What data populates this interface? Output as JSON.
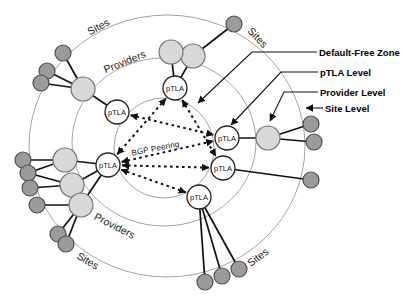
{
  "figure": {
    "colors": {
      "background": "#ffffff",
      "ring_stroke": "#999999",
      "line": "#111111",
      "provider_fill": "#d8d8d8",
      "provider_stroke": "#777777",
      "site_fill": "#9b9b9b",
      "site_stroke": "#4f4f4f",
      "ptla_fill": "#ffffff",
      "ptla_stroke": "#222222"
    },
    "rings": [
      {
        "name": "outer-site-ring",
        "cx": 167,
        "cy": 146,
        "rx": 138,
        "ry": 131
      },
      {
        "name": "middle-provider-ring",
        "cx": 164,
        "cy": 142,
        "rx": 92,
        "ry": 84
      },
      {
        "name": "inner-dfz-circle",
        "cx": 164,
        "cy": 148,
        "rx": 50,
        "ry": 50
      }
    ],
    "ring_labels": [
      {
        "name": "sites-label-top-left",
        "text": "Sites",
        "x": 100,
        "y": 30,
        "rotate": -28
      },
      {
        "name": "providers-label-top-left",
        "text": "Providers",
        "x": 126,
        "y": 65,
        "rotate": -22
      },
      {
        "name": "sites-label-top-right",
        "text": "Sites",
        "x": 255,
        "y": 40,
        "rotate": 47
      },
      {
        "name": "providers-label-bottom-left",
        "text": "Providers",
        "x": 113,
        "y": 229,
        "rotate": 27
      },
      {
        "name": "sites-label-bottom-left",
        "text": "Sites",
        "x": 86,
        "y": 264,
        "rotate": 31
      },
      {
        "name": "sites-label-bottom-right",
        "text": "Sites",
        "x": 260,
        "y": 260,
        "rotate": -37
      }
    ],
    "center_label": {
      "text": "BGP Peering",
      "x": 156,
      "y": 151,
      "rotate": -11
    },
    "nodes": {
      "ptla": {
        "label": "pTLA",
        "radius": 12,
        "items": [
          {
            "id": "ptla-top",
            "x": 175,
            "y": 88
          },
          {
            "id": "ptla-upper-left",
            "x": 117,
            "y": 112
          },
          {
            "id": "ptla-left",
            "x": 108,
            "y": 165
          },
          {
            "id": "ptla-right",
            "x": 227,
            "y": 138
          },
          {
            "id": "ptla-mid-right",
            "x": 223,
            "y": 168
          },
          {
            "id": "ptla-bottom",
            "x": 199,
            "y": 197
          }
        ]
      },
      "providers": {
        "radius": 12,
        "items": [
          {
            "id": "prov-top-2",
            "x": 193,
            "y": 56
          },
          {
            "id": "prov-top-1",
            "x": 171,
            "y": 52
          },
          {
            "id": "prov-upper-left",
            "x": 83,
            "y": 89
          },
          {
            "id": "prov-right",
            "x": 268,
            "y": 138
          },
          {
            "id": "prov-left-1",
            "x": 65,
            "y": 160
          },
          {
            "id": "prov-left-2",
            "x": 72,
            "y": 185
          },
          {
            "id": "prov-left-3",
            "x": 81,
            "y": 205
          }
        ]
      },
      "sites": {
        "radius": 8,
        "items": [
          {
            "id": "site-top-right",
            "x": 234,
            "y": 24
          },
          {
            "id": "site-tl-1",
            "x": 63,
            "y": 53
          },
          {
            "id": "site-tl-2",
            "x": 47,
            "y": 71
          },
          {
            "id": "site-tl-3",
            "x": 41,
            "y": 83
          },
          {
            "id": "site-r-1",
            "x": 311,
            "y": 124
          },
          {
            "id": "site-r-2",
            "x": 314,
            "y": 142
          },
          {
            "id": "site-r-3",
            "x": 311,
            "y": 180
          },
          {
            "id": "site-l-1",
            "x": 23,
            "y": 160
          },
          {
            "id": "site-l-2",
            "x": 28,
            "y": 173
          },
          {
            "id": "site-l-3",
            "x": 30,
            "y": 188
          },
          {
            "id": "site-l-4",
            "x": 37,
            "y": 205
          },
          {
            "id": "site-l-5",
            "x": 58,
            "y": 234
          },
          {
            "id": "site-l-6",
            "x": 66,
            "y": 244
          },
          {
            "id": "site-b-1",
            "x": 205,
            "y": 282
          },
          {
            "id": "site-b-2",
            "x": 222,
            "y": 276
          },
          {
            "id": "site-b-3",
            "x": 239,
            "y": 269
          }
        ]
      }
    },
    "edges": [
      [
        "site-top-right",
        "prov-top-2"
      ],
      [
        "prov-top-1",
        "ptla-top"
      ],
      [
        "prov-top-2",
        "ptla-top"
      ],
      [
        "site-tl-1",
        "prov-upper-left"
      ],
      [
        "site-tl-2",
        "prov-upper-left"
      ],
      [
        "site-tl-3",
        "prov-upper-left"
      ],
      [
        "prov-upper-left",
        "ptla-upper-left"
      ],
      [
        "ptla-right",
        "prov-right"
      ],
      [
        "prov-right",
        "site-r-1"
      ],
      [
        "prov-right",
        "site-r-2"
      ],
      [
        "ptla-mid-right",
        "site-r-3"
      ],
      [
        "ptla-bottom",
        "site-b-1"
      ],
      [
        "ptla-bottom",
        "site-b-2"
      ],
      [
        "ptla-bottom",
        "site-b-3"
      ],
      [
        "site-l-1",
        "prov-left-1"
      ],
      [
        "site-l-2",
        "prov-left-1"
      ],
      [
        "site-l-2",
        "prov-left-2"
      ],
      [
        "site-l-3",
        "prov-left-2"
      ],
      [
        "site-l-4",
        "prov-left-3"
      ],
      [
        "site-l-5",
        "prov-left-3"
      ],
      [
        "site-l-6",
        "prov-left-3"
      ],
      [
        "prov-left-1",
        "ptla-left"
      ],
      [
        "prov-left-2",
        "ptla-left"
      ],
      [
        "prov-left-3",
        "ptla-left"
      ]
    ],
    "bgp_peering_links": [
      [
        "ptla-top",
        "ptla-left"
      ],
      [
        "ptla-top",
        "ptla-mid-right"
      ],
      [
        "ptla-upper-left",
        "ptla-right"
      ],
      [
        "ptla-left",
        "ptla-right"
      ],
      [
        "ptla-left",
        "ptla-mid-right"
      ],
      [
        "ptla-left",
        "ptla-bottom"
      ]
    ],
    "callouts": [
      {
        "name": "default-free-zone",
        "label": "Default-Free Zone",
        "tx": 319,
        "ty": 56,
        "points": [
          [
            317,
            52
          ],
          [
            252,
            52
          ],
          [
            198,
            103
          ]
        ]
      },
      {
        "name": "ptla-level",
        "label": "pTLA Level",
        "tx": 320,
        "ty": 76,
        "points": [
          [
            318,
            72
          ],
          [
            281,
            72
          ],
          [
            231,
            125
          ]
        ]
      },
      {
        "name": "provider-level",
        "label": "Provider Level",
        "tx": 320,
        "ty": 96,
        "points": [
          [
            318,
            92
          ],
          [
            284,
            92
          ],
          [
            270,
            121
          ]
        ]
      },
      {
        "name": "site-level",
        "label": "Site Level",
        "tx": 325,
        "ty": 112,
        "points": [
          [
            323,
            108
          ],
          [
            306,
            108
          ]
        ]
      }
    ]
  }
}
